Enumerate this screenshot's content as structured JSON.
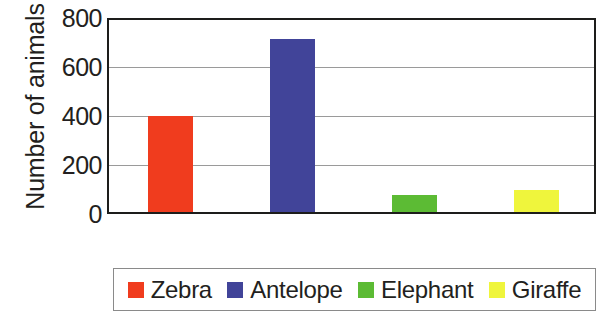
{
  "chart_data": {
    "type": "bar",
    "title": "",
    "xlabel": "",
    "ylabel": "Number of animals",
    "categories": [
      "Zebra",
      "Antelope",
      "Elephant",
      "Giraffe"
    ],
    "values": [
      400,
      720,
      70,
      90
    ],
    "ylim": [
      0,
      800
    ],
    "y_ticks": [
      0,
      200,
      400,
      600,
      800
    ],
    "y_tick_labels": [
      "0",
      "200",
      "400",
      "600",
      "800"
    ],
    "grid": true,
    "legend_position": "bottom",
    "series": [
      {
        "name": "Zebra",
        "value": 400,
        "color": "#f03c1e"
      },
      {
        "name": "Antelope",
        "value": 720,
        "color": "#414499"
      },
      {
        "name": "Elephant",
        "value": 70,
        "color": "#5cbb34"
      },
      {
        "name": "Giraffe",
        "value": 90,
        "color": "#eff53c"
      }
    ]
  },
  "legend": {
    "entries": [
      {
        "label": "Zebra",
        "color": "#f03c1e"
      },
      {
        "label": "Antelope",
        "color": "#414499"
      },
      {
        "label": "Elephant",
        "color": "#5cbb34"
      },
      {
        "label": "Giraffe",
        "color": "#eff53c"
      }
    ]
  },
  "axes": {
    "y_title": "Number of animals"
  },
  "colors": {
    "axis": "#1d1d1b",
    "gridline": "#9a9a9a",
    "legend_border": "#8a8a8a",
    "text": "#231f20",
    "background": "#ffffff"
  }
}
